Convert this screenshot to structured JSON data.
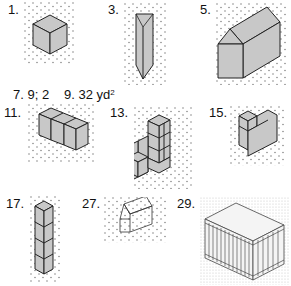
{
  "exercises": [
    {
      "number": "1.",
      "figure": "isometric-cube"
    },
    {
      "number": "3.",
      "figure": "triangular-prism-vertical"
    },
    {
      "number": "5.",
      "figure": "house-prism"
    },
    {
      "number": "11.",
      "figure": "three-cubes-row"
    },
    {
      "number": "13.",
      "figure": "stepped-cube-stack"
    },
    {
      "number": "15.",
      "figure": "l-shaped-solid"
    },
    {
      "number": "17.",
      "figure": "four-cube-tower"
    },
    {
      "number": "27.",
      "figure": "house-wireframe"
    },
    {
      "number": "29.",
      "figure": "ribbed-box"
    }
  ],
  "answers": [
    {
      "number": "7.",
      "value": "9; 2"
    },
    {
      "number": "9.",
      "value": "32 yd",
      "superscript": "2"
    }
  ]
}
